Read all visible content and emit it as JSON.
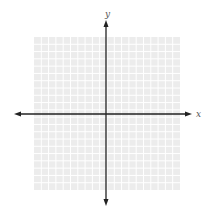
{
  "diagram": {
    "type": "coordinate-plane",
    "grid": {
      "left": 34,
      "top": 37,
      "width": 146,
      "height": 153,
      "cols": 20,
      "rows": 21,
      "background": "#ececec",
      "line_color": "#ffffff"
    },
    "axes": {
      "color": "#222222",
      "origin_x": 106,
      "origin_y": 114,
      "x_axis": {
        "from": 14,
        "to": 192,
        "label": "x"
      },
      "y_axis": {
        "from": 20,
        "to": 206,
        "label": "y"
      }
    }
  }
}
